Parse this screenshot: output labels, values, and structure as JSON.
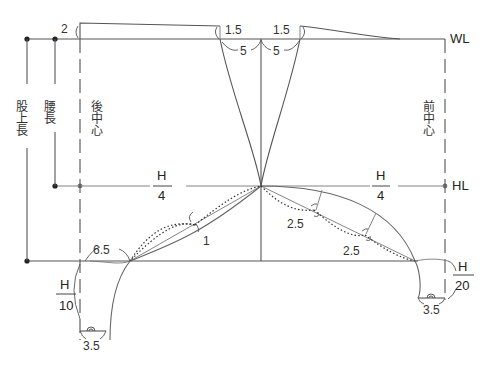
{
  "diagram": {
    "type": "pants-pattern-draft",
    "lines": {
      "waist_line": "WL",
      "hip_line": "HL"
    },
    "vertical_labels": {
      "crotch_depth": "股上長",
      "hip_depth": "腰長",
      "back_center": "後中心",
      "front_center": "前中心"
    },
    "measurements": {
      "back_rise": "2",
      "dart_left_height": "1.5",
      "dart_right_height": "1.5",
      "dart_left_width": "5",
      "dart_right_width": "5",
      "back_hip_num": "H",
      "back_hip_den": "4",
      "front_hip_num": "H",
      "front_hip_den": "4",
      "back_curve_offset": "1",
      "front_curve_offset_1": "2.5",
      "front_curve_offset_2": "2.5",
      "back_crotch_ext": "6.5",
      "back_crotch_drop_num": "H",
      "back_crotch_drop_den": "10",
      "back_inseam_left": "3.5",
      "front_crotch_num": "H",
      "front_crotch_den": "20",
      "front_inseam_right": "3.5"
    }
  }
}
